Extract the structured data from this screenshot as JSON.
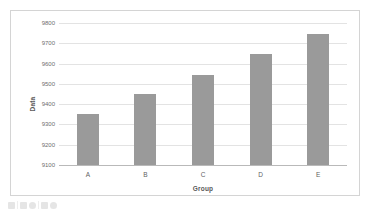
{
  "chart_data": {
    "type": "bar",
    "title": "",
    "subtitle": "",
    "xlabel": "Group",
    "ylabel": "Data",
    "categories": [
      "A",
      "B",
      "C",
      "D",
      "E"
    ],
    "values": [
      9350,
      9450,
      9545,
      9645,
      9745
    ],
    "ylim": [
      9100,
      9800
    ],
    "ytick_labels": [
      "9800",
      "9700",
      "9600",
      "9500",
      "9400",
      "9300",
      "9200",
      "9100"
    ],
    "ytick_values": [
      9800,
      9700,
      9600,
      9500,
      9400,
      9300,
      9200,
      9100
    ],
    "ytick_step": 100,
    "grid": true,
    "legend": false,
    "legend_position": "none",
    "series": [
      {
        "name": "Data",
        "values": [
          9350,
          9450,
          9545,
          9645,
          9745
        ]
      }
    ],
    "annotations": []
  },
  "style": {
    "bar_color": "#9a9a9a",
    "gridline_color": "#e3e3e3",
    "axis_color": "#b9b9b9",
    "frame_border_color": "#d4d4d4",
    "background_color": "#ffffff",
    "tick_label_color": "#6e6e6e",
    "axis_title_color": "#5a5a5a"
  },
  "toolbar": {
    "icons": [
      "square-icon",
      "square-icon",
      "circle-icon",
      "square-icon",
      "circle-icon"
    ],
    "label": ""
  }
}
